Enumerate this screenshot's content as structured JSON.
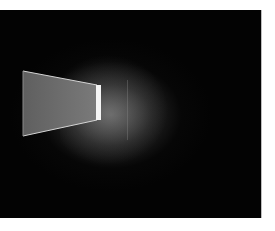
{
  "image": {
    "description": "Dark room light installation: a luminous trapezoidal panel receding toward a bright vertical slit",
    "colors": {
      "background": "#030303",
      "panel_fill": "#6f6f6f",
      "panel_edge": "#d8d8d8",
      "slit": "#f4f4f4",
      "page_background": "#ffffff"
    }
  }
}
